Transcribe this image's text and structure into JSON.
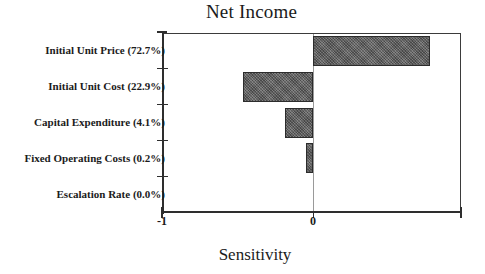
{
  "chart_data": {
    "type": "bar",
    "orientation": "horizontal",
    "subtype": "tornado",
    "title": "Net Income",
    "xlabel": "Sensitivity",
    "ylabel": "",
    "xlim": [
      -1,
      1
    ],
    "xticks": [
      -1,
      0
    ],
    "xticklabels": [
      "-1",
      "0"
    ],
    "grid": false,
    "legend": null,
    "categories": [
      "Initial Unit Price (72.7%)",
      "Initial Unit Cost (22.9%)",
      "Capital Expenditure (4.1%)",
      "Fixed Operating Costs (0.2%)",
      "Escalation Rate (0.0%)"
    ],
    "values": [
      0.79,
      -0.47,
      -0.19,
      -0.05,
      0.0
    ],
    "contributions_pct": [
      72.7,
      22.9,
      4.1,
      0.2,
      0.0
    ],
    "bar_color": "#6a6a6a",
    "bar_edge_color": "#2c2c2c",
    "zero_line_color": "#9a9a9a",
    "axis_color": "#2e2e2e"
  },
  "axis": {
    "x_min_label": "-1",
    "x_zero_label": "0",
    "x_title": "Sensitivity"
  },
  "header": {
    "title": "Net Income"
  }
}
